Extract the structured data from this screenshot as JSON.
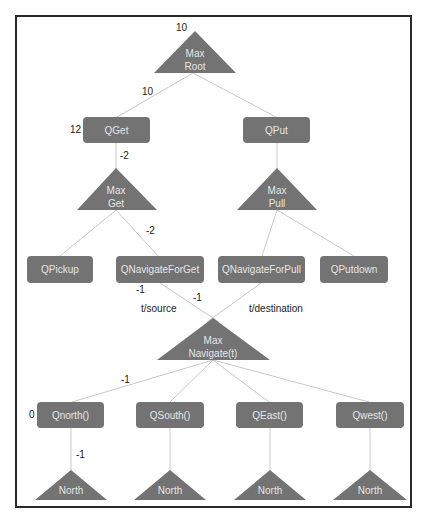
{
  "diagram": {
    "type": "MAXQ task hierarchy",
    "colors": {
      "node_fill": "#737373",
      "node_text": "#e6e6e6",
      "edge": "#c8c8c8",
      "label_text": "#222222",
      "frame": "#2a2a2a"
    },
    "max_nodes": {
      "root": {
        "line1": "Max",
        "line2": "Root",
        "value": "10"
      },
      "get": {
        "line1": "Max",
        "line2": "Get"
      },
      "pull": {
        "line1": "Max",
        "line2": "Pull"
      },
      "navigate": {
        "line1": "Max",
        "line2": "Navigate(t)"
      },
      "north1": {
        "label": "North"
      },
      "north2": {
        "label": "North"
      },
      "north3": {
        "label": "North"
      },
      "north4": {
        "label": "North"
      }
    },
    "q_nodes": {
      "qget": {
        "label": "QGet",
        "value": "12"
      },
      "qput": {
        "label": "QPut"
      },
      "qpickup": {
        "label": "QPickup"
      },
      "qnavforget": {
        "label": "QNavigateForGet"
      },
      "qnavforpull": {
        "label": "QNavigateForPull"
      },
      "qputdown": {
        "label": "QPutdown"
      },
      "qnorth": {
        "label": "Qnorth()",
        "value": "0"
      },
      "qsouth": {
        "label": "QSouth()"
      },
      "qeast": {
        "label": "QEast()"
      },
      "qwest": {
        "label": "Qwest()"
      }
    },
    "edge_labels": {
      "root_qget": "10",
      "qget_maxget": "-2",
      "maxget_qnavforget": "-2",
      "qnavforget_left": "-1",
      "qnavforget_right": "-1",
      "t_source": "t/source",
      "t_destination": "t/destination",
      "navigate_qnorth": "-1",
      "qnorth_north": "-1"
    }
  }
}
